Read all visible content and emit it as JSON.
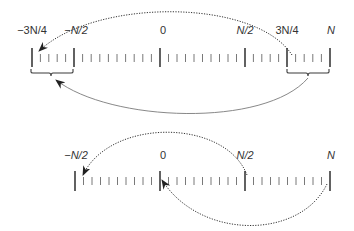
{
  "colors": {
    "stroke": "#3a3a3a",
    "minor_tick": "#6a6a6a",
    "solid_arc": "#7a7a7a",
    "text": "#333333"
  },
  "top_line": {
    "labels": {
      "neg_3n_4": "−3N/4",
      "neg_n_2": "−N/2",
      "zero": "0",
      "n_2": "N/2",
      "three_n_4": "3N/4",
      "n": "N"
    },
    "major_ticks_x": [
      32,
      74,
      160,
      245,
      287,
      330
    ],
    "brackets": [
      {
        "from": "−3N/4",
        "to": "−N/2"
      },
      {
        "from": "3N/4",
        "to": "N"
      }
    ],
    "arcs": [
      {
        "style": "dotted",
        "from": "3N/4",
        "to": "−3N/4",
        "direction": "over"
      },
      {
        "style": "solid",
        "from": "bracket 3N/4..N",
        "to": "bracket −3N/4..−N/2",
        "direction": "under"
      }
    ]
  },
  "bottom_line": {
    "labels": {
      "neg_n_2": "−N/2",
      "zero": "0",
      "n_2": "N/2",
      "n": "N"
    },
    "major_ticks_x": [
      75,
      160,
      245,
      330
    ],
    "arcs": [
      {
        "style": "dotted",
        "from": "N/2",
        "to": "−N/2",
        "direction": "over"
      },
      {
        "style": "dotted",
        "from": "N",
        "to": "0",
        "direction": "under"
      }
    ]
  }
}
